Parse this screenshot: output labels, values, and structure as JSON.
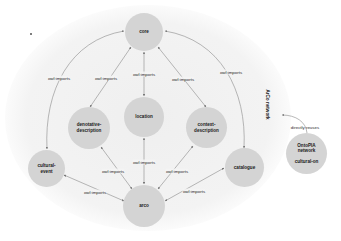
{
  "diagram": {
    "network_label": "ArCo network",
    "colors": {
      "background_ellipse": "#f2f2f2",
      "node_fill": "#d4d4d4",
      "edge": "#8a8a8a",
      "text": "#1a1a1a"
    },
    "nodes": [
      {
        "id": "core",
        "label": "core"
      },
      {
        "id": "location",
        "label": "location"
      },
      {
        "id": "denotative-description",
        "label": "denotative-\ndescription"
      },
      {
        "id": "context-description",
        "label": "context-\ndescription"
      },
      {
        "id": "cultural-event",
        "label": "cultural-\nevent"
      },
      {
        "id": "catalogue",
        "label": "catalogue"
      },
      {
        "id": "arco",
        "label": "arco"
      },
      {
        "id": "ontopia",
        "label": "OntoPIA\nnetwork\n\ncultural-on"
      }
    ],
    "edges": [
      {
        "from": "cultural-event",
        "to": "core",
        "label": "owl:imports"
      },
      {
        "from": "denotative-description",
        "to": "core",
        "label": "owl:imports"
      },
      {
        "from": "location",
        "to": "core",
        "label": "owl:imports"
      },
      {
        "from": "context-description",
        "to": "core",
        "label": "owl:imports"
      },
      {
        "from": "catalogue",
        "to": "core",
        "label": "owl:imports"
      },
      {
        "from": "arco",
        "to": "denotative-description",
        "label": "owl:imports"
      },
      {
        "from": "arco",
        "to": "location",
        "label": "owl:imports"
      },
      {
        "from": "arco",
        "to": "context-description",
        "label": "owl:imports"
      },
      {
        "from": "arco",
        "to": "cultural-event",
        "label": "owl:imports"
      },
      {
        "from": "arco",
        "to": "catalogue",
        "label": "owl:imports"
      },
      {
        "from": "ontopia",
        "to": "ArCo network",
        "label": "directly reuses"
      }
    ]
  }
}
